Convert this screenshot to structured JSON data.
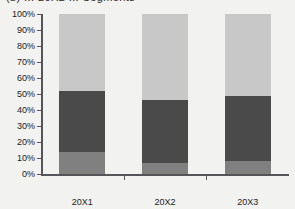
{
  "title": {
    "text": "(b) ... 20X2 ... Segments"
  },
  "axis": {
    "y_ticks": [
      "0%",
      "10%",
      "20%",
      "30%",
      "40%",
      "50%",
      "60%",
      "70%",
      "80%",
      "90%",
      "100%"
    ],
    "x_ticks": [
      "20X1",
      "20X2",
      "20X3"
    ]
  },
  "colors": {
    "series_bottom": "#808080",
    "series_middle": "#4a4a4a",
    "series_top": "#c8c8c8",
    "axis": "#55565a",
    "background": "#f2f2f0",
    "text": "#1c1c1c"
  },
  "chart_data": {
    "type": "bar",
    "stacked": true,
    "normalized": true,
    "title": "(b) ... 20X2 ... Segments",
    "xlabel": "",
    "ylabel": "",
    "ylim": [
      0,
      100
    ],
    "grid": false,
    "legend": "none",
    "categories": [
      "20X1",
      "20X2",
      "20X3"
    ],
    "series": [
      {
        "name": "Series 1",
        "color": "#808080",
        "values": [
          14,
          7,
          8
        ]
      },
      {
        "name": "Series 2",
        "color": "#4a4a4a",
        "values": [
          38,
          39,
          41
        ]
      },
      {
        "name": "Series 3",
        "color": "#c8c8c8",
        "values": [
          48,
          54,
          51
        ]
      }
    ],
    "cumulative_tops": [
      {
        "category": "20X1",
        "bottom_top": 14,
        "middle_top": 52,
        "total": 100
      },
      {
        "category": "20X2",
        "bottom_top": 7,
        "middle_top": 46,
        "total": 100
      },
      {
        "category": "20X3",
        "bottom_top": 8,
        "middle_top": 49,
        "total": 100
      }
    ]
  }
}
